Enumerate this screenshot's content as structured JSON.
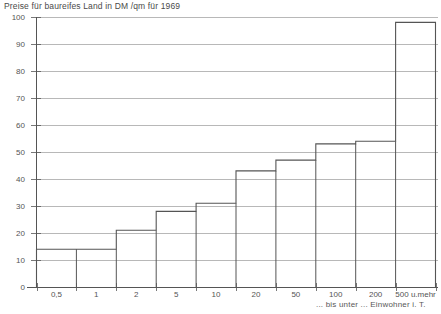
{
  "chart_data": {
    "type": "bar",
    "title": "Preise für baureifes Land in DM /qm für 1969",
    "xlabel": "... bis unter ... Einwohner i. T.",
    "ylabel": "",
    "categories": [
      "0,5",
      "1",
      "2",
      "5",
      "10",
      "20",
      "50",
      "100",
      "200",
      "500 u.mehr"
    ],
    "values": [
      14,
      14,
      21,
      28,
      31,
      43,
      47,
      53,
      54,
      98
    ],
    "ylim": [
      0,
      100
    ],
    "ytick_labels": [
      "0",
      "10",
      "20",
      "30",
      "40",
      "50",
      "60",
      "70",
      "80",
      "90",
      "100"
    ],
    "ytick_values": [
      0,
      10,
      20,
      30,
      40,
      50,
      60,
      70,
      80,
      90,
      100
    ],
    "grid": true,
    "legend": "none",
    "style": "step-histogram",
    "line_color": "#555555",
    "grid_color": "#9a9a9a",
    "axis_color": "#555555",
    "background": "#ffffff"
  }
}
